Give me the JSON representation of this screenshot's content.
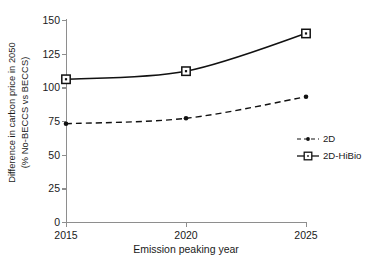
{
  "chart_data": {
    "type": "line",
    "title": "",
    "xlabel": "Emission peaking year",
    "ylabel_line1": "Difference in carbon price in 2050",
    "ylabel_line2": "(% No-BECCS vs BECCS)",
    "x": [
      2015,
      2020,
      2025
    ],
    "xtick_labels": [
      "2015",
      "2020",
      "2025"
    ],
    "ytick_labels": [
      "0",
      "25",
      "50",
      "75",
      "100",
      "125",
      "150"
    ],
    "ytick_values": [
      0,
      25,
      50,
      75,
      100,
      125,
      150
    ],
    "ylim": [
      0,
      150
    ],
    "xlim": [
      2015,
      2025
    ],
    "grid": false,
    "legend_position": "right",
    "series": [
      {
        "name": "2D",
        "values": [
          73,
          77,
          93
        ],
        "line_style": "dashed",
        "marker": "dot",
        "color": "#111111"
      },
      {
        "name": "2D-HiBio",
        "values": [
          106,
          112,
          140
        ],
        "line_style": "solid",
        "marker": "square",
        "color": "#111111"
      }
    ]
  },
  "legend": {
    "items": [
      {
        "label": "2D"
      },
      {
        "label": "2D-HiBio"
      }
    ]
  },
  "colors": {
    "axis": "#8e8e8e",
    "text": "#1a1a1a",
    "series": "#111111",
    "background": "#ffffff"
  }
}
